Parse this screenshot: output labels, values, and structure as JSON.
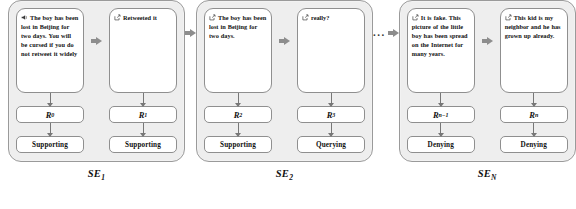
{
  "diagram": {
    "colors": {
      "group_background": "#eeeeee",
      "group_border": "#9a9a9a",
      "bubble_background": "#ffffff",
      "bubble_border": "#8f8f8f",
      "arrow": "#8d8d8d",
      "connector": "#777777",
      "text": "#111111",
      "page_background": "#ffffff"
    },
    "ellipsis": "...",
    "groups": [
      {
        "caption_base": "SE",
        "caption_sub": "1",
        "caption_name": "se-1",
        "posts": [
          {
            "icon": "megaphone-icon",
            "text": "The boy has been lost in Beijing for two days. You will be cursed if you do not retweet it widely",
            "node_base": "R",
            "node_sub": "0",
            "stance": "Supporting"
          },
          {
            "icon": "retweet-icon",
            "text": "Retweeted it",
            "node_base": "R",
            "node_sub": "1",
            "stance": "Supporting"
          }
        ]
      },
      {
        "caption_base": "SE",
        "caption_sub": "2",
        "caption_name": "se-2",
        "posts": [
          {
            "icon": "retweet-icon",
            "text": "The boy has been lost in Beijing for two days.",
            "node_base": "R",
            "node_sub": "2",
            "stance": "Supporting"
          },
          {
            "icon": "retweet-icon",
            "text": "really?",
            "node_base": "R",
            "node_sub": "3",
            "stance": "Querying"
          }
        ]
      },
      {
        "caption_base": "SE",
        "caption_sub": "N",
        "caption_name": "se-n",
        "posts": [
          {
            "icon": "retweet-icon",
            "text": "It is fake. This picture of the little boy has been spread on the Internet for many years.",
            "node_base": "R",
            "node_sub": "n−1",
            "stance": "Denying"
          },
          {
            "icon": "retweet-icon",
            "text": "This kid is my neighbor and he has grown up already.",
            "node_base": "R",
            "node_sub": "n",
            "stance": "Denying"
          }
        ]
      }
    ]
  }
}
